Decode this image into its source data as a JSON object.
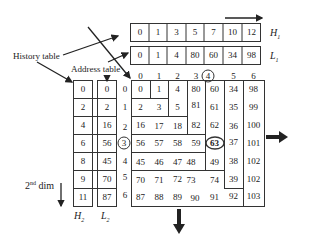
{
  "labels": {
    "history_table": "History table",
    "address_table": "Address table",
    "second_dim": "2",
    "second_dim_sup": "nd",
    "second_dim_rest": " dim",
    "H1": "H",
    "H1_sub": "1",
    "L1": "L",
    "L1_sub": "1",
    "H2": "H",
    "H2_sub": "2",
    "L2": "L",
    "L2_sub": "2"
  },
  "top_tables": {
    "H1": [
      "0",
      "1",
      "3",
      "5",
      "7",
      "10",
      "12"
    ],
    "L1": [
      "0",
      "1",
      "4",
      "80",
      "60",
      "34",
      "98"
    ]
  },
  "side_tables": {
    "H2": [
      "0",
      "2",
      "4",
      "6",
      "8",
      "9",
      "11"
    ],
    "L2": [
      "0",
      "2",
      "16",
      "56",
      "45",
      "70",
      "87"
    ]
  },
  "grid": {
    "col_indices": [
      "0",
      "1",
      "2",
      "3",
      "4",
      "5",
      "6"
    ],
    "row_indices": [
      "0",
      "1",
      "2",
      "3",
      "4",
      "5",
      "6"
    ],
    "circled_col": "4",
    "circled_row": "3",
    "circled_cell": "63",
    "rows": [
      [
        "0",
        "1",
        "4",
        "80",
        "60",
        "34",
        "98"
      ],
      [
        "2",
        "3",
        "5",
        "81",
        "61",
        "35",
        "99"
      ],
      [
        "16",
        "17",
        "18",
        "82",
        "62",
        "36",
        "100"
      ],
      [
        "56",
        "57",
        "58",
        "59",
        "63",
        "37",
        "101"
      ],
      [
        "45",
        "46",
        "47",
        "48",
        "49",
        "38",
        "102"
      ],
      [
        "70",
        "71",
        "72",
        "73",
        "74",
        "39",
        "102"
      ],
      [
        "87",
        "88",
        "89",
        "90",
        "91",
        "92",
        "103"
      ]
    ]
  }
}
